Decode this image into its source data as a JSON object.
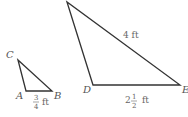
{
  "small_triangle": {
    "vertices": {
      "C": "C",
      "A": "A",
      "B": "B"
    },
    "side_AB": {
      "whole": "",
      "numerator": "3",
      "denominator": "4",
      "unit": "ft"
    }
  },
  "large_triangle": {
    "vertices": {
      "D": "D",
      "E": "E"
    },
    "side_hyp": "4 ft",
    "side_DE": {
      "whole": "2",
      "numerator": "1",
      "denominator": "2",
      "unit": "ft"
    }
  }
}
